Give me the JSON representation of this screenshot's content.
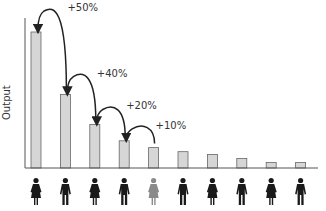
{
  "chart_data": {
    "type": "bar",
    "title": "",
    "xlabel": "",
    "ylabel": "Output",
    "categories": [
      "Person 1",
      "Person 2",
      "Person 3",
      "Person 4",
      "Person 5",
      "Person 6",
      "Person 7",
      "Person 8",
      "Person 9",
      "Person 10"
    ],
    "values": [
      100,
      54,
      32,
      20,
      15,
      12,
      10,
      7,
      4,
      4
    ],
    "ylim": [
      0,
      100
    ],
    "grid": false,
    "annotations": [
      {
        "text": "+50%",
        "from": 1,
        "to": 0
      },
      {
        "text": "+40%",
        "from": 2,
        "to": 1
      },
      {
        "text": "+20%",
        "from": 3,
        "to": 2
      },
      {
        "text": "+10%",
        "from": 4,
        "to": 3
      }
    ],
    "people": [
      {
        "icon": "woman-icon",
        "highlight": false
      },
      {
        "icon": "man-icon",
        "highlight": false
      },
      {
        "icon": "woman-icon",
        "highlight": false
      },
      {
        "icon": "man-icon",
        "highlight": false
      },
      {
        "icon": "woman-icon",
        "highlight": true
      },
      {
        "icon": "man-icon",
        "highlight": false
      },
      {
        "icon": "woman-icon",
        "highlight": false
      },
      {
        "icon": "man-icon",
        "highlight": false
      },
      {
        "icon": "woman-icon",
        "highlight": false
      },
      {
        "icon": "man-icon",
        "highlight": false
      }
    ],
    "colors": {
      "bar_fill": "#d6d6d6",
      "bar_stroke": "#666666",
      "axis": "#555555",
      "arrow": "#222222",
      "person": "#1a1a1a",
      "person_highlight": "#8a8a8a",
      "text": "#333333"
    }
  }
}
